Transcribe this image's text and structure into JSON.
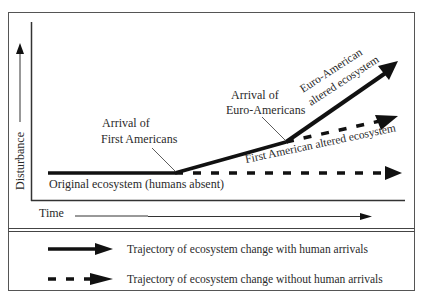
{
  "diagram": {
    "y_axis_label": "Disturbance",
    "x_axis_label": "Time",
    "annotations": {
      "first_americans_line1": "Arrival of",
      "first_americans_line2": "First Americans",
      "euro_americans_line1": "Arrival of",
      "euro_americans_line2": "Euro-Americans",
      "euro_altered_line1": "Euro-American",
      "euro_altered_line2": "altered ecosystem",
      "first_american_altered": "First American altered ecosystem",
      "original": "Original ecosystem (humans absent)"
    },
    "colors": {
      "line": "#111111",
      "frame": "#555555",
      "text": "#2a2a2a",
      "background": "#ffffff"
    }
  },
  "legend": {
    "items": [
      {
        "style": "solid",
        "label": "Trajectory of ecosystem change with human arrivals"
      },
      {
        "style": "dashed",
        "label": "Trajectory of ecosystem change without human arrivals"
      }
    ]
  }
}
